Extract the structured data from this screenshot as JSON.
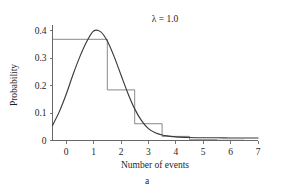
{
  "chart_data": {
    "type": "bar",
    "title": "λ = 1.0",
    "caption": "a",
    "xlabel": "Number of events",
    "ylabel": "Probability",
    "categories": [
      0,
      1,
      2,
      3,
      4,
      5,
      6,
      7
    ],
    "values": [
      0.368,
      0.368,
      0.184,
      0.061,
      0.015,
      0.003,
      0.001,
      0.0
    ],
    "bar_width": 1.0,
    "xlim": [
      -0.5,
      7.0
    ],
    "ylim": [
      0.0,
      0.42
    ],
    "xticks": [
      0,
      1,
      2,
      3,
      4,
      5,
      6,
      7
    ],
    "xtick_labels": [
      "0",
      "1",
      "2",
      "3",
      "4",
      "5",
      "6",
      "7"
    ],
    "yticks": [
      0.0,
      0.1,
      0.2,
      0.3,
      0.4
    ],
    "ytick_labels": [
      "0",
      "0.1",
      "0.2",
      "0.3",
      "0.4"
    ],
    "grid": false,
    "legend": null,
    "series": [
      {
        "name": "Poisson probability histogram",
        "kind": "bar",
        "values": [
          0.368,
          0.368,
          0.184,
          0.061,
          0.015,
          0.003,
          0.001,
          0.0
        ],
        "color": "#6b6b6b"
      },
      {
        "name": "Smooth approximating curve",
        "kind": "line",
        "color": "#3a3a3a",
        "x": [
          -0.5,
          -0.25,
          0.0,
          0.25,
          0.5,
          0.75,
          1.0,
          1.25,
          1.5,
          1.75,
          2.0,
          2.25,
          2.5,
          2.75,
          3.0,
          3.25,
          3.5,
          3.75,
          4.0,
          4.5,
          5.0,
          5.5,
          6.0,
          6.5,
          7.0
        ],
        "y": [
          0.055,
          0.105,
          0.168,
          0.24,
          0.305,
          0.36,
          0.398,
          0.396,
          0.362,
          0.305,
          0.238,
          0.172,
          0.115,
          0.072,
          0.043,
          0.028,
          0.02,
          0.016,
          0.013,
          0.011,
          0.01,
          0.01,
          0.009,
          0.009,
          0.009
        ]
      }
    ],
    "colors": {
      "axis": "#555555",
      "bar_outline": "#6b6b6b",
      "curve": "#3a3a3a",
      "text": "#1f1f1f",
      "background": "#ffffff"
    }
  }
}
